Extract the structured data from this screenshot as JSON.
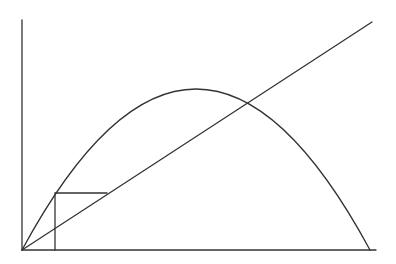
{
  "diagram": {
    "type": "cobweb-plot",
    "stroke_color": "#333333",
    "background": "#ffffff",
    "axes": {
      "origin": [
        22,
        250
      ],
      "y_axis_top": [
        22,
        20
      ],
      "x_axis_end": [
        376,
        250
      ]
    },
    "identity_line": {
      "from": [
        22,
        250
      ],
      "to": [
        372,
        22
      ]
    },
    "parabola": {
      "start": [
        22,
        250
      ],
      "peak": [
        196,
        89
      ],
      "end": [
        370,
        250
      ]
    },
    "cobweb": {
      "points": [
        [
          55,
          250
        ],
        [
          55,
          193
        ],
        [
          107,
          193
        ]
      ]
    }
  }
}
